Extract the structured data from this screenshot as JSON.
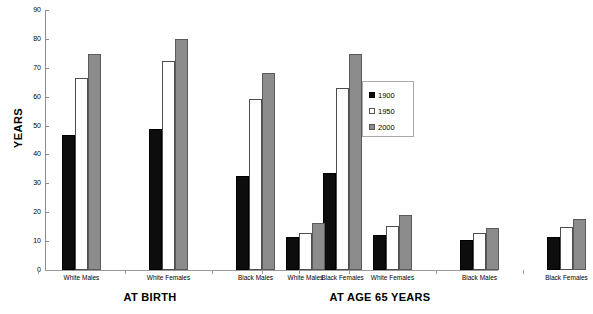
{
  "chart_data": {
    "type": "bar",
    "title": "",
    "xlabel": "",
    "ylabel": "YEARS",
    "ylim": [
      0,
      90
    ],
    "ytick_step": 10,
    "yticks": [
      0,
      10,
      20,
      30,
      40,
      50,
      60,
      70,
      80,
      90
    ],
    "grid": false,
    "legend_position": "center-right",
    "legend": [
      "1900",
      "1950",
      "2000"
    ],
    "series_colors": {
      "1900": "#0d0d0d",
      "1950": "#ffffff",
      "2000": "#8c8c8c"
    },
    "panels": [
      {
        "name": "AT BIRTH",
        "categories": [
          "White Males",
          "White Females",
          "Black Males",
          "Black Females"
        ],
        "series": [
          {
            "name": "1900",
            "values": [
              46.6,
              48.7,
              32.5,
              33.5
            ]
          },
          {
            "name": "1950",
            "values": [
              66.5,
              72.2,
              59.1,
              62.9
            ]
          },
          {
            "name": "2000",
            "values": [
              74.8,
              80.0,
              68.2,
              74.9
            ]
          }
        ]
      },
      {
        "name": "AT AGE 65 YEARS",
        "categories": [
          "White Males",
          "White Females",
          "Black Males",
          "Black Females"
        ],
        "series": [
          {
            "name": "1900",
            "values": [
              11.5,
              12.2,
              10.4,
              11.4
            ]
          },
          {
            "name": "1950",
            "values": [
              12.8,
              15.1,
              12.8,
              14.9
            ]
          },
          {
            "name": "2000",
            "values": [
              16.3,
              19.2,
              14.5,
              17.7
            ]
          }
        ]
      }
    ]
  },
  "axis": {
    "y_title": "YEARS"
  }
}
